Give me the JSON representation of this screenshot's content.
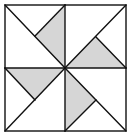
{
  "diagram": {
    "colors": {
      "background": "#ffffff",
      "shaded": "#d6d6d6",
      "stroke": "#111111"
    },
    "quadrants": [
      {
        "name": "top-left",
        "shaded_triangle": true
      },
      {
        "name": "top-right",
        "shaded_triangle": true
      },
      {
        "name": "bottom-left",
        "shaded_triangle": true
      },
      {
        "name": "bottom-right",
        "shaded_triangle": true
      }
    ]
  }
}
